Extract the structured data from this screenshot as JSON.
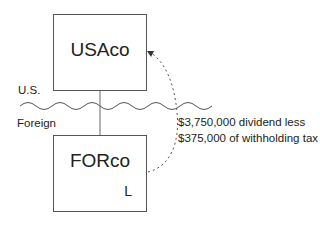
{
  "entities": {
    "parent": {
      "name": "USAco"
    },
    "subsidiary": {
      "name": "FORco",
      "corner_label": "L"
    }
  },
  "regions": {
    "upper": "U.S.",
    "lower": "Foreign"
  },
  "flow": {
    "direction": "FORco to USAco",
    "style": "dashed curved arrow",
    "note_line_1": "$3,750,000 dividend less",
    "note_line_2": "$375,000 of withholding tax"
  },
  "colors": {
    "line": "#555555",
    "text": "#222222",
    "background": "#ffffff"
  }
}
